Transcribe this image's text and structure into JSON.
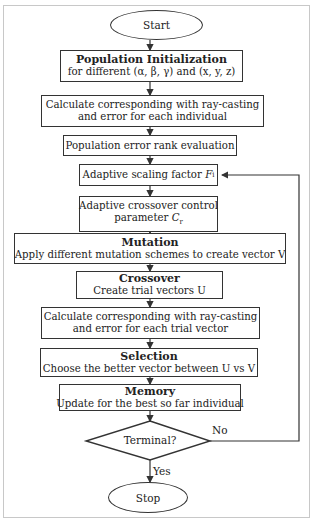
{
  "flowchart": {
    "start": "Start",
    "stop": "Stop",
    "steps": [
      {
        "id": "population-init",
        "title": "Population Initialization",
        "text": "for different (α, β, γ) and (x, y, z)"
      },
      {
        "id": "calc-individual",
        "title": "",
        "line1": "Calculate corresponding with ray-casting",
        "line2": "and error for each individual"
      },
      {
        "id": "rank-eval",
        "title": "",
        "text": "Population error rank evaluation"
      },
      {
        "id": "scaling-factor",
        "title": "",
        "text": "Adaptive scaling factor",
        "symbol": "F",
        "subscript": "i"
      },
      {
        "id": "crossover-control",
        "title": "",
        "line1": "Adaptive crossover control",
        "line2": "parameter",
        "symbol": "C",
        "subscript": "r"
      },
      {
        "id": "mutation",
        "title": "Mutation",
        "text": "Apply different mutation schemes to create vector V"
      },
      {
        "id": "crossover",
        "title": "Crossover",
        "text": "Create trial vectors U"
      },
      {
        "id": "calc-trial",
        "title": "",
        "line1": "Calculate corresponding with ray-casting",
        "line2": "and error for each trial vector"
      },
      {
        "id": "selection",
        "title": "Selection",
        "text": "Choose the better vector between U vs V"
      },
      {
        "id": "memory",
        "title": "Memory",
        "text": "Update for the best so far individual"
      }
    ],
    "decision": {
      "text": "Terminal?",
      "yes_label": "Yes",
      "no_label": "No"
    }
  }
}
